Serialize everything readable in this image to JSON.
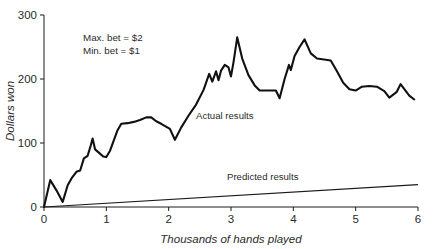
{
  "chart_data": {
    "type": "line",
    "title": "",
    "xlabel": "Thousands of hands played",
    "ylabel": "Dollars won",
    "xlim": [
      0,
      6
    ],
    "ylim": [
      0,
      300
    ],
    "xticks": [
      "0",
      "1",
      "2",
      "3",
      "4",
      "5",
      "6"
    ],
    "yticks": [
      "0",
      "100",
      "200",
      "300"
    ],
    "grid": false,
    "legend_position": "inline-annotation",
    "annotations": [
      "Max. bet = $2",
      "Min. bet = $1"
    ],
    "series": [
      {
        "name": "Actual results",
        "label": "Actual results",
        "color": "#111111",
        "points": [
          [
            0.0,
            0
          ],
          [
            0.1,
            42
          ],
          [
            0.2,
            26
          ],
          [
            0.3,
            8
          ],
          [
            0.38,
            34
          ],
          [
            0.45,
            46
          ],
          [
            0.52,
            55
          ],
          [
            0.58,
            57
          ],
          [
            0.64,
            76
          ],
          [
            0.7,
            80
          ],
          [
            0.75,
            96
          ],
          [
            0.78,
            107
          ],
          [
            0.82,
            90
          ],
          [
            0.88,
            85
          ],
          [
            0.95,
            79
          ],
          [
            1.0,
            78
          ],
          [
            1.06,
            88
          ],
          [
            1.12,
            104
          ],
          [
            1.18,
            120
          ],
          [
            1.24,
            130
          ],
          [
            1.34,
            131
          ],
          [
            1.44,
            133
          ],
          [
            1.54,
            136
          ],
          [
            1.64,
            140
          ],
          [
            1.72,
            140
          ],
          [
            1.8,
            134
          ],
          [
            1.88,
            130
          ],
          [
            1.95,
            126
          ],
          [
            2.02,
            122
          ],
          [
            2.1,
            105
          ],
          [
            2.2,
            124
          ],
          [
            2.32,
            143
          ],
          [
            2.44,
            160
          ],
          [
            2.56,
            183
          ],
          [
            2.65,
            208
          ],
          [
            2.7,
            196
          ],
          [
            2.76,
            212
          ],
          [
            2.8,
            198
          ],
          [
            2.84,
            213
          ],
          [
            2.9,
            222
          ],
          [
            2.96,
            218
          ],
          [
            3.0,
            204
          ],
          [
            3.04,
            226
          ],
          [
            3.1,
            265
          ],
          [
            3.18,
            232
          ],
          [
            3.28,
            206
          ],
          [
            3.38,
            190
          ],
          [
            3.46,
            182
          ],
          [
            3.6,
            182
          ],
          [
            3.72,
            182
          ],
          [
            3.78,
            170
          ],
          [
            3.86,
            200
          ],
          [
            3.93,
            222
          ],
          [
            3.96,
            214
          ],
          [
            4.02,
            236
          ],
          [
            4.1,
            250
          ],
          [
            4.18,
            262
          ],
          [
            4.28,
            240
          ],
          [
            4.38,
            232
          ],
          [
            4.52,
            230
          ],
          [
            4.6,
            229
          ],
          [
            4.7,
            212
          ],
          [
            4.8,
            194
          ],
          [
            4.9,
            184
          ],
          [
            5.0,
            182
          ],
          [
            5.1,
            188
          ],
          [
            5.22,
            189
          ],
          [
            5.34,
            188
          ],
          [
            5.46,
            181
          ],
          [
            5.54,
            171
          ],
          [
            5.66,
            180
          ],
          [
            5.72,
            192
          ],
          [
            5.86,
            174
          ],
          [
            5.94,
            168
          ]
        ]
      },
      {
        "name": "Predicted results",
        "label": "Predicted results",
        "color": "#1a1a1a",
        "points": [
          [
            0.0,
            0
          ],
          [
            6.0,
            35
          ]
        ]
      }
    ]
  }
}
